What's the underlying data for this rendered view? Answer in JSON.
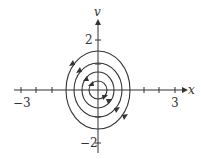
{
  "diagram": {
    "type": "phase-portrait",
    "axes": {
      "x_label": "x",
      "y_label": "v",
      "x_tick_labels": {
        "min": "−3",
        "max": "3"
      },
      "y_tick_labels": {
        "max": "2",
        "min": "−2"
      },
      "xlim": [
        -3,
        3
      ],
      "ylim": [
        -2.3,
        2.3
      ]
    },
    "orbits": [
      {
        "name": "orbit-1",
        "rx": 0.35,
        "ry": 0.45
      },
      {
        "name": "orbit-2",
        "rx": 0.8,
        "ry": 0.9
      },
      {
        "name": "orbit-3",
        "rx": 1.3,
        "ry": 1.5
      },
      {
        "name": "orbit-4",
        "rx": 1.8,
        "ry": 2.2
      }
    ],
    "flow_direction": "clockwise",
    "colors": {
      "stroke": "#333333",
      "background": "#ffffff"
    }
  }
}
